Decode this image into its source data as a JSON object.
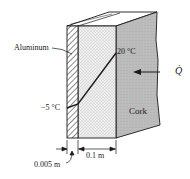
{
  "figure": {
    "type": "composite-wall-diagram",
    "layers": [
      {
        "name": "Aluminum",
        "label": "Aluminum",
        "thickness": "0.005 m",
        "fill": "hatched"
      },
      {
        "name": "Insulation",
        "label": "",
        "thickness": "0.1 m",
        "fill": "stippled"
      },
      {
        "name": "Cork",
        "label": "Cork",
        "fill": "gray-stippled"
      }
    ],
    "temperatures": {
      "inner": "−5 °C",
      "outer": "20 °C"
    },
    "heat_flow": {
      "label": "Q̇",
      "direction": "left"
    },
    "dimensions": {
      "aluminum_thickness": "0.005 m",
      "insulation_thickness": "0.1 m"
    },
    "colors": {
      "line": "#1a1a1a",
      "cork": "#bdbdbd",
      "insulation": "#ececec",
      "background": "#ffffff"
    }
  }
}
